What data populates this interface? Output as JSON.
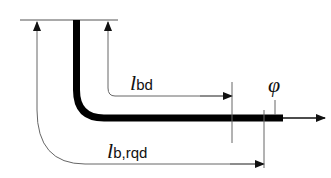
{
  "diagram": {
    "labels": {
      "lbd": {
        "main": "l",
        "sub": "bd"
      },
      "lbrqd": {
        "main": "l",
        "sub": "b,rqd"
      },
      "phi": "φ"
    },
    "colors": {
      "bar": "#000000",
      "line": "#333333",
      "background": "#ffffff"
    }
  }
}
